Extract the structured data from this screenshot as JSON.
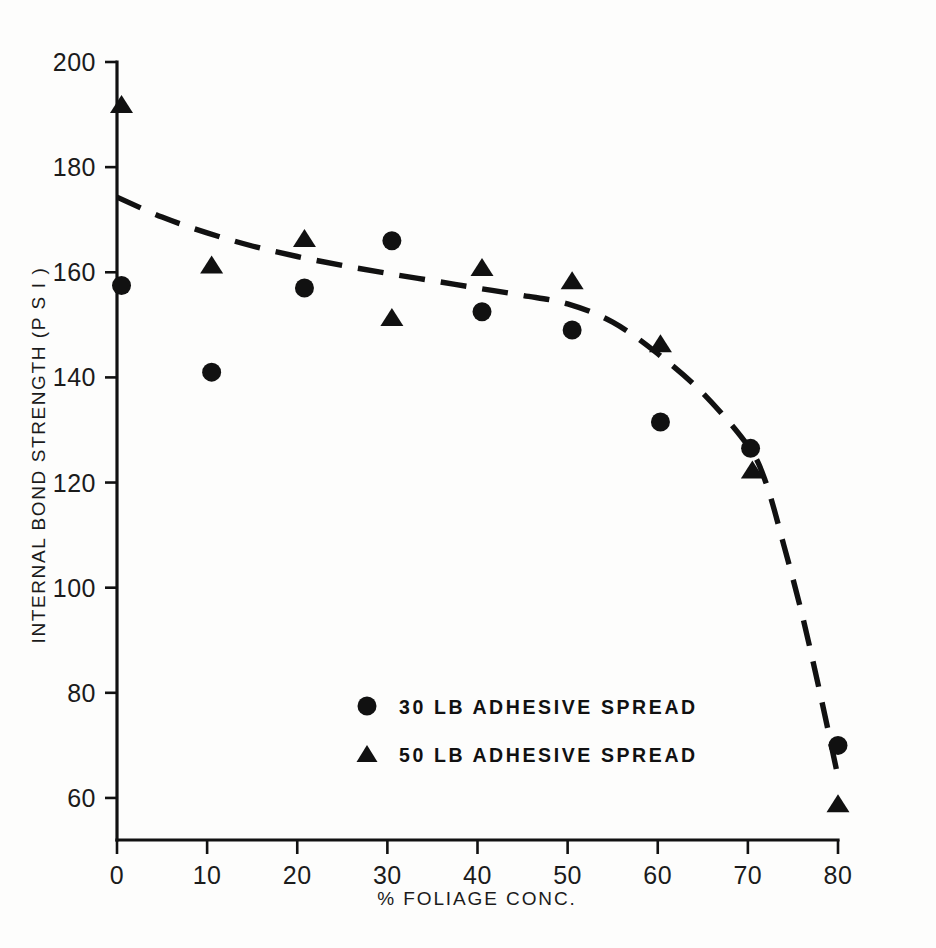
{
  "chart_data": {
    "type": "scatter",
    "title": "",
    "xlabel": "% FOLIAGE CONC.",
    "ylabel": "INTERNAL BOND STRENGTH (P S I )",
    "xlim": [
      0,
      80
    ],
    "ylim": [
      60,
      200
    ],
    "grid": false,
    "legend_position": "center-left-lower",
    "x_ticks": [
      0,
      10,
      20,
      30,
      40,
      50,
      60,
      70,
      80
    ],
    "x_tick_labels": [
      "0",
      "10",
      "20",
      "30",
      "40",
      "50",
      "60",
      "70",
      "80"
    ],
    "y_ticks": [
      60,
      80,
      100,
      120,
      140,
      160,
      180,
      200
    ],
    "y_tick_labels": [
      "60",
      "80",
      "100",
      "120",
      "140",
      "160",
      "180",
      "200"
    ],
    "series": [
      {
        "name": "30 LB ADHESIVE SPREAD",
        "marker": "circle",
        "color": "#111111",
        "points": [
          {
            "x": 0.5,
            "y": 157.5
          },
          {
            "x": 10.5,
            "y": 141
          },
          {
            "x": 20.8,
            "y": 157
          },
          {
            "x": 30.5,
            "y": 166
          },
          {
            "x": 40.5,
            "y": 152.5
          },
          {
            "x": 50.5,
            "y": 149
          },
          {
            "x": 60.3,
            "y": 131.5
          },
          {
            "x": 70.3,
            "y": 126.5
          },
          {
            "x": 80,
            "y": 70
          }
        ]
      },
      {
        "name": "50 LB ADHESIVE SPREAD",
        "marker": "triangle",
        "color": "#111111",
        "points": [
          {
            "x": 0.5,
            "y": 192
          },
          {
            "x": 10.5,
            "y": 161.5
          },
          {
            "x": 20.8,
            "y": 166.5
          },
          {
            "x": 30.5,
            "y": 151.5
          },
          {
            "x": 40.5,
            "y": 161
          },
          {
            "x": 50.5,
            "y": 158.5
          },
          {
            "x": 60.3,
            "y": 146.5
          },
          {
            "x": 70.5,
            "y": 122.5
          },
          {
            "x": 80,
            "y": 59
          }
        ]
      }
    ],
    "trend_curve": {
      "style": "dashed",
      "color": "#111111",
      "points": [
        {
          "x": 0,
          "y": 174.3
        },
        {
          "x": 5,
          "y": 170.5
        },
        {
          "x": 10,
          "y": 167.5
        },
        {
          "x": 15,
          "y": 165.0
        },
        {
          "x": 20,
          "y": 163.0
        },
        {
          "x": 25,
          "y": 161.3
        },
        {
          "x": 30,
          "y": 159.8
        },
        {
          "x": 35,
          "y": 158.4
        },
        {
          "x": 40,
          "y": 157.0
        },
        {
          "x": 45,
          "y": 155.6
        },
        {
          "x": 50,
          "y": 154.0
        },
        {
          "x": 55,
          "y": 150.5
        },
        {
          "x": 60,
          "y": 144.5
        },
        {
          "x": 65,
          "y": 137.0
        },
        {
          "x": 70,
          "y": 127.0
        },
        {
          "x": 72,
          "y": 120.0
        },
        {
          "x": 74,
          "y": 108.0
        },
        {
          "x": 76,
          "y": 95.0
        },
        {
          "x": 78,
          "y": 80.0
        },
        {
          "x": 80,
          "y": 64.0
        }
      ]
    }
  },
  "legend": {
    "entries": [
      {
        "marker": "circle",
        "label": "30 LB ADHESIVE SPREAD"
      },
      {
        "marker": "triangle",
        "label": "50 LB ADHESIVE SPREAD"
      }
    ]
  },
  "axes": {
    "x_title": "% FOLIAGE CONC.",
    "y_title": "INTERNAL BOND STRENGTH (P S I )"
  }
}
